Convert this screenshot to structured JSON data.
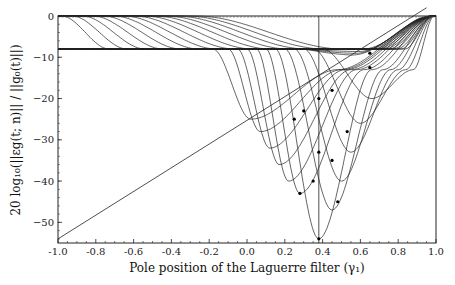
{
  "chart_data": {
    "type": "line",
    "title": "",
    "xlabel": "Pole position of the Laguerre filter (γ₁)",
    "ylabel": "20 log₁₀(||εg(t; n)|| / ||g₀(t)||)",
    "xlim": [
      -1.0,
      1.0
    ],
    "ylim": [
      -55,
      0
    ],
    "xticks": [
      -1.0,
      -0.8,
      -0.6,
      -0.4,
      -0.2,
      0.0,
      0.2,
      0.4,
      0.6,
      0.8,
      1.0
    ],
    "xtick_labels": [
      "-1.0",
      "-0.8",
      "-0.6",
      "-0.4",
      "-0.2",
      "0.0",
      "0.2",
      "0.4",
      "0.6",
      "0.8",
      "1.0"
    ],
    "yticks": [
      0,
      -10,
      -20,
      -30,
      -40,
      -50
    ],
    "ytick_labels": [
      "0",
      "−10",
      "−20",
      "−30",
      "−40",
      "−50"
    ],
    "grid": false,
    "legend": null,
    "annotations": {
      "vertical_line_x": 0.38,
      "diagonal_line": {
        "x": [
          -1.0,
          0.95
        ],
        "y": [
          -54,
          2
        ]
      },
      "zero_dashed_line_y": 0
    },
    "upper_family": {
      "description": "Curves starting at 0 dB at γ=-1, decaying to plateau near -8 dB, rising back to 0 at γ=1",
      "count": 14
    },
    "lower_family": {
      "description": "Curves departing the -8 dB plateau and dipping to minima between -25 and -55 dB near γ≈0.2–0.5",
      "count": 12,
      "minima": [
        {
          "x": 0.65,
          "y": -9
        },
        {
          "x": 0.65,
          "y": -12.5
        },
        {
          "x": 0.45,
          "y": -18
        },
        {
          "x": 0.38,
          "y": -20
        },
        {
          "x": 0.3,
          "y": -23
        },
        {
          "x": 0.25,
          "y": -25
        },
        {
          "x": 0.53,
          "y": -28
        },
        {
          "x": 0.38,
          "y": -33
        },
        {
          "x": 0.45,
          "y": -35
        },
        {
          "x": 0.35,
          "y": -40
        },
        {
          "x": 0.48,
          "y": -45
        },
        {
          "x": 0.28,
          "y": -43
        },
        {
          "x": 0.38,
          "y": -54
        }
      ]
    }
  }
}
